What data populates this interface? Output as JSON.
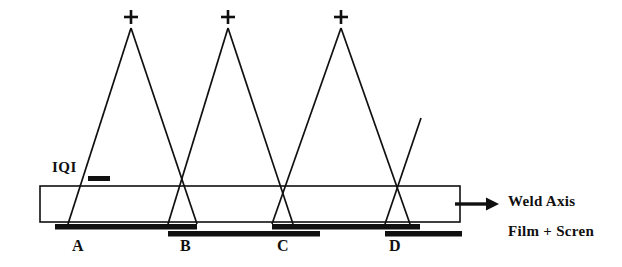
{
  "diagram": {
    "colors": {
      "ink": "#101010",
      "background": "#ffffff",
      "outline": "#101010"
    },
    "weld_specimen": {
      "label": "Weld Axis",
      "arrow_icon": "right-arrow-icon",
      "rect": {
        "x": 40,
        "y": 186,
        "width": 420,
        "height": 36
      }
    },
    "film": {
      "label": "Film + Scren",
      "strips": [
        {
          "id": "A",
          "label": "A",
          "x": 55,
          "y": 224,
          "width": 142,
          "tier": "upper"
        },
        {
          "id": "B",
          "label": "B",
          "x": 168,
          "y": 231,
          "width": 152,
          "tier": "lower"
        },
        {
          "id": "C",
          "label": "C",
          "x": 272,
          "y": 224,
          "width": 148,
          "tier": "upper"
        },
        {
          "id": "D",
          "label": "D",
          "x": 385,
          "y": 231,
          "width": 77,
          "tier": "lower"
        }
      ]
    },
    "iqi": {
      "label": "IQI",
      "marker": {
        "x": 88,
        "y": 176,
        "width": 22,
        "height": 5
      }
    },
    "sources": [
      {
        "index": 1,
        "marker": "plus-icon",
        "apex_x": 131,
        "apex_y": 28,
        "left_foot_x": 68,
        "right_foot_x": 197
      },
      {
        "index": 2,
        "marker": "plus-icon",
        "apex_x": 228,
        "apex_y": 28,
        "left_foot_x": 168,
        "right_foot_x": 293
      },
      {
        "index": 3,
        "marker": "plus-icon",
        "apex_x": 341,
        "apex_y": 28,
        "left_foot_x": 272,
        "right_foot_x": 410
      }
    ],
    "partial_beam": {
      "from_x": 385,
      "from_y": 224,
      "to_x": 421,
      "to_y": 118
    }
  }
}
